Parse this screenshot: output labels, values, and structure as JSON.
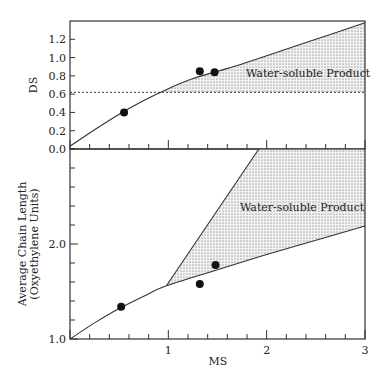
{
  "chart_data": [
    {
      "type": "line",
      "panel": "top",
      "title": "",
      "xlabel": "MS",
      "ylabel": "DS",
      "xlim": [
        0,
        3
      ],
      "ylim": [
        0,
        1.4
      ],
      "x_ticks_major": [
        0,
        1,
        2,
        3
      ],
      "x_ticks_minor_step": 0.2,
      "y_ticks": [
        0.0,
        0.2,
        0.4,
        0.6,
        0.8,
        1.0,
        1.2
      ],
      "y_tick_labels": [
        "0.0",
        "0.2",
        "0.4",
        "0.6",
        "0.8",
        "1.0",
        "1.2"
      ],
      "series": [
        {
          "name": "DS curve",
          "style": "solid",
          "x": [
            0,
            0.25,
            0.5,
            0.75,
            1.0,
            1.25,
            1.5,
            1.75,
            2.0,
            2.5,
            3.0
          ],
          "y": [
            0.03,
            0.21,
            0.38,
            0.53,
            0.66,
            0.77,
            0.85,
            0.93,
            1.02,
            1.2,
            1.38
          ]
        },
        {
          "name": "threshold",
          "style": "dashed",
          "x": [
            0,
            3
          ],
          "y": [
            0.62,
            0.62
          ]
        }
      ],
      "points": [
        {
          "x": 0.55,
          "y": 0.4
        },
        {
          "x": 1.32,
          "y": 0.85
        },
        {
          "x": 1.47,
          "y": 0.84
        }
      ],
      "shaded_region": {
        "label": "Water-soluble  Product",
        "lower_y": 0.62,
        "x_from": 0.97,
        "x_to": 3.0
      }
    },
    {
      "type": "line",
      "panel": "bottom",
      "title": "",
      "xlabel": "MS",
      "ylabel": "Average  Chain  Length\n(Oxyethylene  Units)",
      "ylabel_lines": [
        "Average  Chain  Length",
        "(Oxyethylene  Units)"
      ],
      "xlim": [
        0,
        3
      ],
      "ylim": [
        1.0,
        3.0
      ],
      "x_ticks_major": [
        1,
        2,
        3
      ],
      "x_tick_labels": [
        "1",
        "2",
        "3"
      ],
      "x_ticks_minor_step": 0.2,
      "y_ticks_labeled": [
        1.0,
        2.0
      ],
      "y_tick_labels": [
        "1.0",
        "2.0"
      ],
      "y_ticks_minor_step": 0.2,
      "series": [
        {
          "name": "chain length curve",
          "style": "solid",
          "x": [
            0,
            0.25,
            0.5,
            0.75,
            0.98,
            1.5,
            2.0,
            2.5,
            3.0
          ],
          "y": [
            1.0,
            1.17,
            1.32,
            1.45,
            1.56,
            1.73,
            1.89,
            2.04,
            2.19
          ]
        },
        {
          "name": "upper boundary",
          "style": "solid",
          "x": [
            0.98,
            1.92
          ],
          "y": [
            1.56,
            3.0
          ]
        }
      ],
      "points": [
        {
          "x": 0.52,
          "y": 1.34
        },
        {
          "x": 1.32,
          "y": 1.58
        },
        {
          "x": 1.48,
          "y": 1.78
        }
      ],
      "shaded_region": {
        "label": "Water-soluble  Product",
        "x_from": 0.98,
        "x_to": 3.0
      }
    }
  ],
  "colors": {
    "axis": "#333333",
    "ink": "#111111",
    "shade_dot": "#555555"
  }
}
